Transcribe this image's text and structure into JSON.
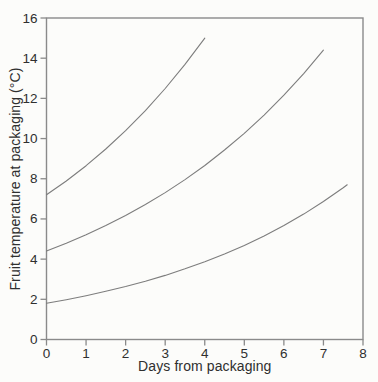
{
  "figure": {
    "background_color": "#fcfcfa",
    "text_color": "#2f2f2f",
    "axis_color": "#8a8a8a",
    "curve_color": "#7d7d7d"
  },
  "chart_data": {
    "type": "line",
    "title": "",
    "xlabel": "Days from packaging",
    "ylabel": "Fruit temperature at packaging (°C)",
    "xlim": [
      0,
      8
    ],
    "ylim": [
      0,
      16
    ],
    "xticks": [
      0,
      1,
      2,
      3,
      4,
      5,
      6,
      7,
      8
    ],
    "yticks": [
      0,
      2,
      4,
      6,
      8,
      10,
      12,
      14,
      16
    ],
    "grid": false,
    "legend_position": "none",
    "series": [
      {
        "name": "upper-curve",
        "x": [
          0,
          0.5,
          1,
          1.5,
          2,
          2.5,
          3,
          3.5,
          4
        ],
        "y": [
          7.2,
          7.89,
          8.65,
          9.48,
          10.39,
          11.39,
          12.49,
          13.69,
          15.0
        ]
      },
      {
        "name": "middle-curve",
        "x": [
          0,
          0.5,
          1,
          1.5,
          2,
          2.5,
          3,
          3.5,
          4,
          4.5,
          5,
          5.5,
          6,
          6.5,
          7
        ],
        "y": [
          4.4,
          4.79,
          5.21,
          5.67,
          6.17,
          6.72,
          7.31,
          7.96,
          8.66,
          9.43,
          10.26,
          11.17,
          12.16,
          13.23,
          14.4
        ]
      },
      {
        "name": "lower-curve",
        "x": [
          0,
          0.5,
          1,
          1.5,
          2,
          2.5,
          3,
          3.5,
          4,
          4.5,
          5,
          5.5,
          6,
          6.5,
          7,
          7.5,
          7.6
        ],
        "y": [
          1.8,
          1.98,
          2.18,
          2.4,
          2.64,
          2.9,
          3.19,
          3.52,
          3.87,
          4.26,
          4.68,
          5.15,
          5.67,
          6.24,
          6.87,
          7.55,
          7.7
        ]
      }
    ]
  }
}
